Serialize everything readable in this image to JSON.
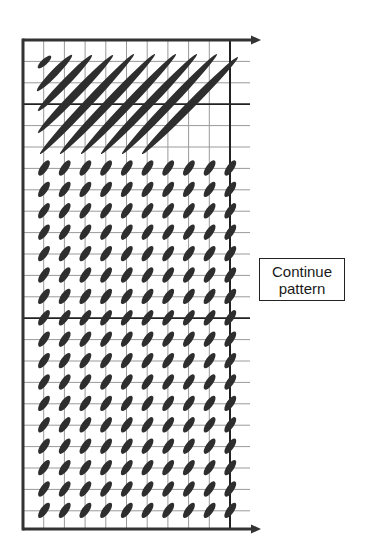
{
  "diagram": {
    "type": "knitting-chart-stitch-pattern",
    "colors": {
      "grid_thin": "#9a9a9a",
      "grid_thick": "#222222",
      "axis": "#333333",
      "stitch": "#2e2e2e",
      "background": "#ffffff"
    },
    "grid": {
      "left_x": 23,
      "right_x": 230,
      "top_y": 40,
      "bottom_axis_y": 529,
      "line_extent_x": 250,
      "columns": 10,
      "col_step": 20.7,
      "row_step": 21.4,
      "row_lines": 23,
      "thick_row_indices": [
        3,
        13
      ],
      "arrow_tip_x": 261
    },
    "long_strokes": [
      {
        "x1": 38,
        "y1": 68,
        "x2": 51,
        "y2": 56,
        "w": 6
      },
      {
        "x1": 37,
        "y1": 91,
        "x2": 72,
        "y2": 55,
        "w": 7
      },
      {
        "x1": 38,
        "y1": 111,
        "x2": 92,
        "y2": 55,
        "w": 7.5
      },
      {
        "x1": 38,
        "y1": 133,
        "x2": 113,
        "y2": 55,
        "w": 8
      },
      {
        "x1": 40,
        "y1": 154,
        "x2": 134,
        "y2": 54,
        "w": 8
      },
      {
        "x1": 60,
        "y1": 154,
        "x2": 155,
        "y2": 54,
        "w": 8
      },
      {
        "x1": 81,
        "y1": 154,
        "x2": 176,
        "y2": 54,
        "w": 8
      },
      {
        "x1": 101,
        "y1": 154,
        "x2": 197,
        "y2": 54,
        "w": 8
      },
      {
        "x1": 122,
        "y1": 154,
        "x2": 217,
        "y2": 54,
        "w": 8
      },
      {
        "x1": 142,
        "y1": 154,
        "x2": 238,
        "y2": 57,
        "w": 8
      }
    ],
    "small_stitches": {
      "first_row_y": 168,
      "rows": 17,
      "columns": 10,
      "first_col_x": 44,
      "rx": 9,
      "ry": 3.6,
      "angle_deg": -55
    },
    "label": {
      "line1": "Continue",
      "line2": "pattern"
    }
  }
}
